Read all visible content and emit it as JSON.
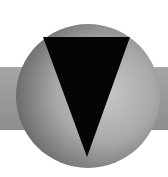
{
  "logo": {
    "name": "circle-triangle-emblem",
    "colors": {
      "background": "#ffffff",
      "band": "#9a9a9a",
      "sphere_light": "#c4c4c4",
      "sphere_dark": "#6e6e6e",
      "triangle": "#050505"
    }
  }
}
